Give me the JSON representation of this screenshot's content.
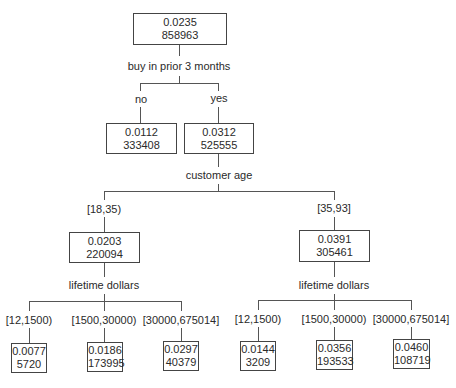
{
  "tree": {
    "root": {
      "rate": "0.0235",
      "count": "858963",
      "split": "buy in prior 3 months"
    },
    "level1": [
      {
        "branch": "no",
        "rate": "0.0112",
        "count": "333408"
      },
      {
        "branch": "yes",
        "rate": "0.0312",
        "count": "525555",
        "split": "customer age"
      }
    ],
    "level2": [
      {
        "branch": "[18,35)",
        "rate": "0.0203",
        "count": "220094",
        "split": "lifetime dollars"
      },
      {
        "branch": "[35,93]",
        "rate": "0.0391",
        "count": "305461",
        "split": "lifetime dollars"
      }
    ],
    "leaves_left": [
      {
        "branch": "[12,1500)",
        "rate": "0.0077",
        "count": "5720"
      },
      {
        "branch": "[1500,30000)",
        "rate": "0.0186",
        "count": "173995"
      },
      {
        "branch": "[30000,675014]",
        "rate": "0.0297",
        "count": "40379"
      }
    ],
    "leaves_right": [
      {
        "branch": "[12,1500)",
        "rate": "0.0144",
        "count": "3209"
      },
      {
        "branch": "[1500,30000)",
        "rate": "0.0356",
        "count": "193533"
      },
      {
        "branch": "[30000,675014]",
        "rate": "0.0460",
        "count": "108719"
      }
    ]
  }
}
